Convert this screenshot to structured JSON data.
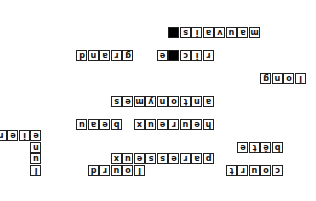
{
  "puzzle": {
    "type": "crossword",
    "orientation": "upside-down",
    "cell_px": 11.5,
    "origin": {
      "x": 33,
      "y": 25
    },
    "black_cells": [
      [
        10,
        9
      ],
      [
        12,
        9
      ]
    ],
    "words": [
      {
        "text": "court",
        "r": 0,
        "c": 0,
        "dir": "across"
      },
      {
        "text": "lourd",
        "r": 0,
        "c": 12,
        "dir": "across"
      },
      {
        "text": "lune",
        "r": 0,
        "c": 21,
        "dir": "down"
      },
      {
        "text": "paresseux",
        "r": 1,
        "c": 6,
        "dir": "across"
      },
      {
        "text": "bête",
        "r": 2,
        "c": 0,
        "dir": "across"
      },
      {
        "text": "fier",
        "r": 3,
        "c": 21,
        "dir": "across"
      },
      {
        "text": "heureux",
        "r": 4,
        "c": 6,
        "dir": "across"
      },
      {
        "text": "beau",
        "r": 4,
        "c": 14,
        "dir": "across"
      },
      {
        "text": "antonymes",
        "r": 6,
        "c": 6,
        "dir": "across"
      },
      {
        "text": "long",
        "r": 8,
        "c": -2,
        "dir": "across"
      },
      {
        "text": "riche",
        "r": 10,
        "c": 6,
        "dir": "across"
      },
      {
        "text": "grand",
        "r": 10,
        "c": 13,
        "dir": "across"
      },
      {
        "text": "mauvais",
        "r": 12,
        "c": 2,
        "dir": "across"
      }
    ]
  }
}
